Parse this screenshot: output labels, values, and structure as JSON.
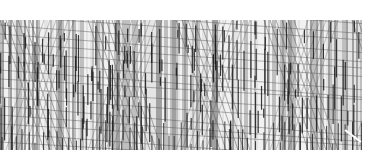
{
  "pattern": {
    "description": "dense grayscale line texture",
    "area": {
      "x": 0,
      "y": 20,
      "width": 362,
      "height": 130
    },
    "background": "#d8d8d8",
    "stripe_colors": [
      "#f4f4f4",
      "#bdbdbd",
      "#9a9a9a",
      "#e6e6e6"
    ],
    "dark_color": "#1a1a1a",
    "diagonal_color": "#555555",
    "zigzag_period": 88,
    "corner_mark": {
      "x": 345,
      "y": 130,
      "color": "#ffffff"
    }
  }
}
